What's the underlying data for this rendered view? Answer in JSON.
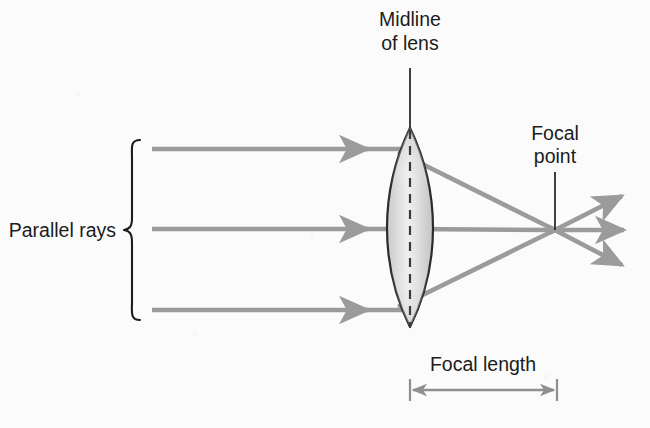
{
  "figure": {
    "background_color": "#fbfbfb",
    "labels": {
      "midline_line1": "Midline",
      "midline_line2": "of lens",
      "focal_point_line1": "Focal",
      "focal_point_line2": "point",
      "parallel_rays": "Parallel rays",
      "focal_length": "Focal length"
    },
    "colors": {
      "ray": "#9b9b9b",
      "lens_outline": "#2b2b2b",
      "lens_fill_light": "#f2f2f2",
      "lens_fill_dark": "#bdbdbd",
      "text": "#1c1c1c",
      "leader": "#2b2b2b",
      "dimension_arrow": "#8f8f8f"
    },
    "geometry": {
      "lens": {
        "center_x": 410,
        "top_y": 128,
        "bottom_y": 327,
        "half_width": 23,
        "shape": "biconvex"
      },
      "midline": {
        "x": 410,
        "leader_top_y": 68,
        "leader_bottom_y": 128,
        "dash_top_y": 128,
        "dash_bottom_y": 327,
        "style": "dashed"
      },
      "focal_point": {
        "x": 555,
        "y": 230,
        "leader_top_y": 152,
        "leader_bottom_y": 230
      },
      "rays": [
        {
          "name": "top-ray",
          "start_x": 152,
          "y": 149,
          "arrow_x": 365,
          "lens_exit_x": 422,
          "lens_exit_y": 163
        },
        {
          "name": "middle-ray",
          "start_x": 152,
          "y": 229,
          "arrow_x": 365,
          "lens_exit_x": 433,
          "lens_exit_y": 229
        },
        {
          "name": "bottom-ray",
          "start_x": 152,
          "y": 310,
          "arrow_x": 365,
          "lens_exit_x": 422,
          "lens_exit_y": 296
        }
      ],
      "diverging_rays": [
        {
          "name": "diverging-ray-upper",
          "end_x": 622,
          "end_y": 196
        },
        {
          "name": "diverging-ray-middle",
          "end_x": 622,
          "end_y": 230
        },
        {
          "name": "diverging-ray-lower",
          "end_x": 622,
          "end_y": 265
        }
      ],
      "brace": {
        "x": 130,
        "top_y": 140,
        "bottom_y": 320,
        "mid_y": 230
      },
      "focal_length_arrow": {
        "left_x": 410,
        "right_x": 557,
        "y": 390,
        "cap_half_height": 11
      }
    }
  }
}
